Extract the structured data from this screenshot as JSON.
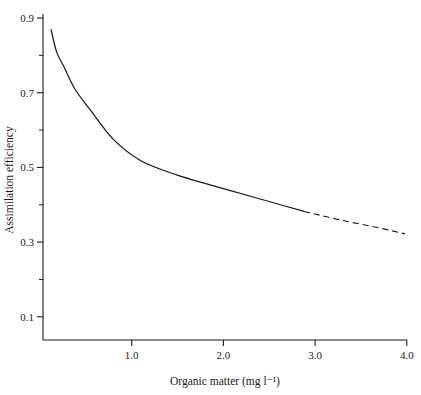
{
  "chart_data": {
    "type": "scatter",
    "title": "",
    "xlabel": "Organic matter (mg l⁻¹)",
    "ylabel": "Assimilation efficiency",
    "xlim": [
      0.0,
      4.0
    ],
    "ylim": [
      0.0,
      0.95
    ],
    "grid": false,
    "legend": "none",
    "x_ticks": [
      1.0,
      2.0,
      3.0,
      4.0
    ],
    "x_tick_labels": [
      "1.0",
      "2.0",
      "3.0",
      "4.0"
    ],
    "x_minor_ticks": [
      0.5,
      1.5,
      2.5,
      3.5
    ],
    "y_ticks": [
      0.1,
      0.3,
      0.5,
      0.7,
      0.9
    ],
    "y_tick_labels": [
      "0.1",
      "0.3",
      "0.5",
      "0.7",
      "0.9"
    ],
    "y_minor_ticks": [
      0.2,
      0.4,
      0.6,
      0.8
    ],
    "series": [
      {
        "name": "fitted curve (filled circles)",
        "marker": "filled-circle",
        "line": "solid-with-dashed-extrapolation",
        "points": [
          {
            "x": 0.12,
            "y": 0.87
          },
          {
            "x": 0.18,
            "y": 0.81
          },
          {
            "x": 0.26,
            "y": 0.77
          },
          {
            "x": 0.38,
            "y": 0.71
          },
          {
            "x": 0.56,
            "y": 0.65
          },
          {
            "x": 1.49,
            "y": 0.48
          },
          {
            "x": 2.88,
            "y": 0.38
          }
        ]
      },
      {
        "name": "open squares",
        "marker": "open-square",
        "line": "none",
        "points": [
          {
            "x": 1.13,
            "y": 0.6
          },
          {
            "x": 1.16,
            "y": 0.4
          },
          {
            "x": 1.93,
            "y": 0.27
          },
          {
            "x": 2.02,
            "y": 0.51
          },
          {
            "x": 2.0,
            "y": 0.4
          },
          {
            "x": 2.96,
            "y": 0.37
          },
          {
            "x": 3.4,
            "y": 0.27
          }
        ]
      },
      {
        "name": "plus markers",
        "marker": "plus",
        "line": "none",
        "points": [
          {
            "x": 1.6,
            "y": 0.63
          },
          {
            "x": 1.87,
            "y": 0.31
          },
          {
            "x": 2.97,
            "y": 0.4
          }
        ]
      }
    ],
    "curve_path_points": [
      {
        "x": 0.12,
        "y": 0.87
      },
      {
        "x": 0.18,
        "y": 0.81
      },
      {
        "x": 0.26,
        "y": 0.77
      },
      {
        "x": 0.38,
        "y": 0.71
      },
      {
        "x": 0.56,
        "y": 0.65
      },
      {
        "x": 0.8,
        "y": 0.575
      },
      {
        "x": 1.1,
        "y": 0.518
      },
      {
        "x": 1.49,
        "y": 0.48
      },
      {
        "x": 2.0,
        "y": 0.443
      },
      {
        "x": 2.45,
        "y": 0.412
      },
      {
        "x": 2.88,
        "y": 0.382
      }
    ],
    "dashed_path_points": [
      {
        "x": 2.88,
        "y": 0.382
      },
      {
        "x": 3.3,
        "y": 0.358
      },
      {
        "x": 3.7,
        "y": 0.338
      },
      {
        "x": 3.98,
        "y": 0.322
      }
    ],
    "colors": {
      "foreground": "#1a1a1a",
      "background": "#ffffff"
    }
  }
}
